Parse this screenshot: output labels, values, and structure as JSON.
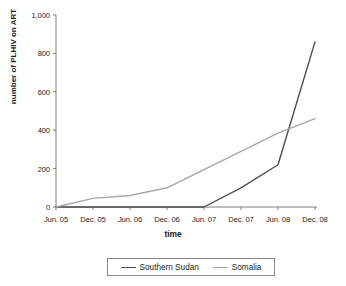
{
  "chart_data": {
    "type": "line",
    "title": "",
    "xlabel": "time",
    "ylabel": "number of PLHIV on ART",
    "categories": [
      "Jun. 05",
      "Dec. 05",
      "Jun. 06",
      "Dec. 06",
      "Jun. 07",
      "Dec. 07",
      "Jun. 08",
      "Dec. 08"
    ],
    "ylim": [
      0,
      1000
    ],
    "yticks": [
      0,
      200,
      400,
      600,
      800,
      1000
    ],
    "ytick_labels": [
      "0",
      "200",
      "400",
      "600",
      "800",
      "1,000"
    ],
    "grid": false,
    "legend_position": "bottom",
    "series": [
      {
        "name": "Southern Sudan",
        "color": "#4d4d4d",
        "values": [
          0,
          0,
          0,
          0,
          0,
          100,
          220,
          860
        ]
      },
      {
        "name": "Somalia",
        "color": "#a6a6a6",
        "values": [
          0,
          45,
          60,
          100,
          195,
          290,
          385,
          460
        ]
      }
    ]
  },
  "axes": {
    "y_title": "number of PLHIV on ART",
    "x_title": "time"
  },
  "legend": {
    "items": [
      {
        "label": "Southern Sudan",
        "color": "#4d4d4d"
      },
      {
        "label": "Somalia",
        "color": "#a6a6a6"
      }
    ]
  },
  "colors": {
    "axis": "#7d7d7d",
    "text": "#231f20",
    "background": "#ffffff",
    "legend_border": "#8a8a8a"
  }
}
